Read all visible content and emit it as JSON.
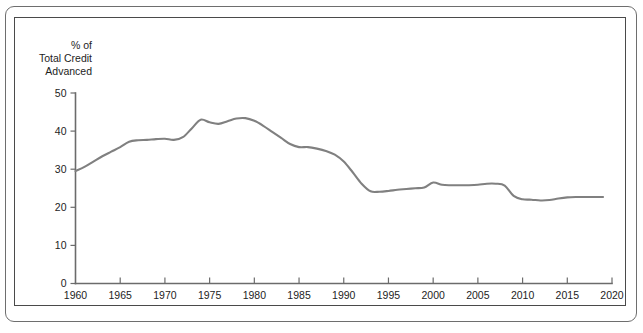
{
  "figure": {
    "background_color": "#ffffff",
    "frame_color": "#6e6e6e",
    "inner_frame_color": "#4a4a4a"
  },
  "chart_data": {
    "type": "line",
    "title": "",
    "subtitle": "",
    "xlabel": "",
    "ylabel": "% of\nTotal Credit\nAdvanced",
    "ylabel_lines": [
      "% of",
      "Total Credit",
      "Advanced"
    ],
    "xlim": [
      1960,
      2020
    ],
    "ylim": [
      0,
      50
    ],
    "yticks": [
      0,
      10,
      20,
      30,
      40,
      50
    ],
    "ytick_labels": [
      "0",
      "10",
      "20",
      "30",
      "40",
      "50"
    ],
    "xticks": [
      1960,
      1965,
      1970,
      1975,
      1980,
      1985,
      1990,
      1995,
      2000,
      2005,
      2010,
      2015,
      2020
    ],
    "xtick_labels": [
      "1960",
      "1965",
      "1970",
      "1975",
      "1980",
      "1985",
      "1990",
      "1995",
      "2000",
      "2005",
      "2010",
      "2015",
      "2020"
    ],
    "grid": false,
    "legend": null,
    "legend_position": "none",
    "annotations": [],
    "series": [
      {
        "name": "Share of total credit advanced",
        "color": "#808080",
        "line_width": 2.1,
        "x": [
          1960,
          1961,
          1962,
          1963,
          1964,
          1965,
          1966,
          1967,
          1968,
          1969,
          1970,
          1971,
          1972,
          1973,
          1974,
          1975,
          1976,
          1977,
          1978,
          1979,
          1980,
          1981,
          1982,
          1983,
          1984,
          1985,
          1986,
          1987,
          1988,
          1989,
          1990,
          1991,
          1992,
          1993,
          1994,
          1995,
          1996,
          1997,
          1998,
          1999,
          2000,
          2001,
          2002,
          2003,
          2004,
          2005,
          2006,
          2007,
          2008,
          2009,
          2010,
          2011,
          2012,
          2013,
          2014,
          2015,
          2016,
          2017,
          2018,
          2019
        ],
        "values": [
          29.5,
          30.6,
          32.0,
          33.4,
          34.6,
          35.8,
          37.2,
          37.6,
          37.7,
          37.9,
          38.0,
          37.7,
          38.4,
          40.7,
          43.0,
          42.3,
          41.9,
          42.6,
          43.3,
          43.4,
          42.7,
          41.4,
          39.8,
          38.2,
          36.6,
          35.8,
          35.8,
          35.4,
          34.8,
          33.8,
          32.0,
          29.2,
          26.2,
          24.2,
          24.1,
          24.3,
          24.6,
          24.8,
          25.0,
          25.2,
          26.5,
          25.9,
          25.8,
          25.8,
          25.8,
          25.9,
          26.2,
          26.2,
          25.7,
          23.0,
          22.1,
          22.0,
          21.8,
          21.9,
          22.3,
          22.6,
          22.7,
          22.7,
          22.7,
          22.7
        ]
      }
    ]
  },
  "axes": {
    "tick_color": "#6b6b6b",
    "label_color": "#1d1d1d"
  }
}
